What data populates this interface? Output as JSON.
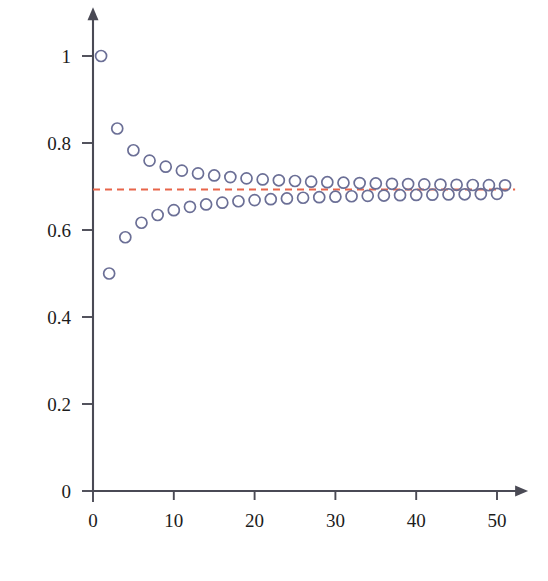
{
  "chart_data": {
    "type": "scatter",
    "title": "",
    "xlabel": "",
    "ylabel": "",
    "xlim": [
      0,
      51.5
    ],
    "ylim": [
      0,
      1.08
    ],
    "grid": false,
    "legend": "none",
    "marker": {
      "shape": "circle-open",
      "edge_color": "#6b6f96",
      "fill": "none",
      "diameter_px": 11
    },
    "xticks": [
      0,
      10,
      20,
      30,
      40,
      50
    ],
    "xtick_labels": [
      "0",
      "10",
      "20",
      "30",
      "40",
      "50"
    ],
    "yticks": [
      0,
      0.2,
      0.4,
      0.6,
      0.8,
      1
    ],
    "ytick_labels": [
      "0",
      "0.2",
      "0.4",
      "0.6",
      "0.8",
      "1"
    ],
    "annotations": [
      {
        "name": "limit-line",
        "type": "horizontal-dashed-line",
        "y": 0.693,
        "color": "#e8654a",
        "label": ""
      }
    ],
    "series": [
      {
        "name": "partial-sums",
        "x": [
          1,
          2,
          3,
          4,
          5,
          6,
          7,
          8,
          9,
          10,
          11,
          12,
          13,
          14,
          15,
          16,
          17,
          18,
          19,
          20,
          21,
          22,
          23,
          24,
          25,
          26,
          27,
          28,
          29,
          30,
          31,
          32,
          33,
          34,
          35,
          36,
          37,
          38,
          39,
          40,
          41,
          42,
          43,
          44,
          45,
          46,
          47,
          48,
          49,
          50,
          51
        ],
        "values": [
          1,
          0.5,
          0.8333,
          0.5833,
          0.7833,
          0.6167,
          0.7595,
          0.6345,
          0.7456,
          0.6456,
          0.7365,
          0.6532,
          0.7301,
          0.6587,
          0.7254,
          0.6629,
          0.7216,
          0.6661,
          0.7187,
          0.6687,
          0.7163,
          0.6708,
          0.7143,
          0.6726,
          0.7126,
          0.6741,
          0.7111,
          0.6754,
          0.7099,
          0.6765,
          0.7088,
          0.6776,
          0.7079,
          0.6785,
          0.707,
          0.6792,
          0.7062,
          0.68,
          0.7056,
          0.6806,
          0.7049,
          0.6811,
          0.7044,
          0.6817,
          0.7039,
          0.6821,
          0.7034,
          0.6826,
          0.7031,
          0.6831,
          0.7027
        ]
      }
    ]
  },
  "axes": {
    "x_axis_name": "x-axis",
    "y_axis_name": "y-axis",
    "axis_color": "#4a4a55",
    "arrowheads": true
  }
}
